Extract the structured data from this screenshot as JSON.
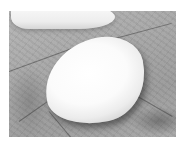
{
  "image": {
    "description": "Grayscale photo of a smooth white egg-shaped pebble resting on the palm of a hand, with a second white pebble partially visible at the top edge",
    "subjects": [
      "white-pebble",
      "palm",
      "second-white-pebble"
    ],
    "colors": {
      "border": "#ffffff",
      "palm": "#a9a9a9",
      "pebble": "#fbfbfb"
    }
  }
}
